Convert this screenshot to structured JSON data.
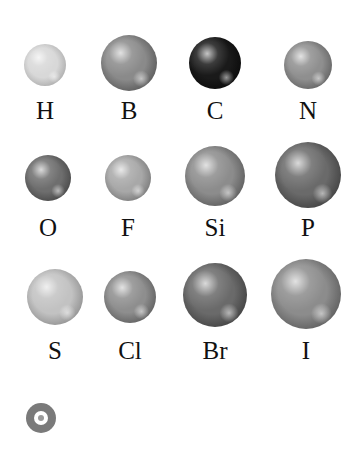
{
  "diagram": {
    "type": "atom-sphere-legend",
    "atoms": [
      {
        "symbol": "H",
        "cx": 45,
        "cy": 65,
        "r": 21,
        "base": "#d8d8d8",
        "dark": "#8e8e8e",
        "label_y": 98
      },
      {
        "symbol": "B",
        "cx": 129,
        "cy": 63,
        "r": 28,
        "base": "#8a8a8a",
        "dark": "#3a3a3a",
        "label_y": 98
      },
      {
        "symbol": "C",
        "cx": 215,
        "cy": 63,
        "r": 26,
        "base": "#1a1a1a",
        "dark": "#000000",
        "label_y": 98
      },
      {
        "symbol": "N",
        "cx": 308,
        "cy": 65,
        "r": 24,
        "base": "#8f8f8f",
        "dark": "#454545",
        "label_y": 98
      },
      {
        "symbol": "O",
        "cx": 48,
        "cy": 178,
        "r": 23,
        "base": "#6e6e6e",
        "dark": "#2e2e2e",
        "label_y": 215
      },
      {
        "symbol": "F",
        "cx": 128,
        "cy": 178,
        "r": 23,
        "base": "#a8a8a8",
        "dark": "#5a5a5a",
        "label_y": 215
      },
      {
        "symbol": "Si",
        "cx": 215,
        "cy": 176,
        "r": 30,
        "base": "#8c8c8c",
        "dark": "#3c3c3c",
        "label_y": 215
      },
      {
        "symbol": "P",
        "cx": 308,
        "cy": 175,
        "r": 33,
        "base": "#6a6a6a",
        "dark": "#262626",
        "label_y": 215
      },
      {
        "symbol": "S",
        "cx": 55,
        "cy": 297,
        "r": 28,
        "base": "#c2c2c2",
        "dark": "#6e6e6e",
        "label_y": 338
      },
      {
        "symbol": "Cl",
        "cx": 130,
        "cy": 297,
        "r": 26,
        "base": "#8e8e8e",
        "dark": "#404040",
        "label_y": 338
      },
      {
        "symbol": "Br",
        "cx": 215,
        "cy": 295,
        "r": 32,
        "base": "#6a6a6a",
        "dark": "#262626",
        "label_y": 338
      },
      {
        "symbol": "I",
        "cx": 306,
        "cy": 294,
        "r": 35,
        "base": "#8c8c8c",
        "dark": "#3e3e3e",
        "label_y": 338
      }
    ]
  },
  "footer_icon": {
    "name": "target-icon",
    "cx": 41,
    "cy": 418,
    "r": 15,
    "color": "#7a7a7a"
  }
}
